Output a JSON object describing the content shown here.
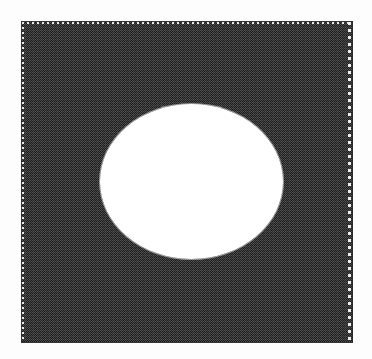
{
  "figure": {
    "caption": "",
    "background_color": "#fdfdfd",
    "panel": {
      "name": "dark-halftone-square",
      "fill_color": "#4b4b4b",
      "dither_dark_color": "#1c1c1c",
      "outline_color": "#2a2a2a",
      "x": 21,
      "y": 21,
      "width": 332,
      "height": 322
    },
    "inner_rule": {
      "name": "dotted-inner-border",
      "color": "#e8e8e8",
      "style": "dotted",
      "edges": [
        "top",
        "left",
        "right"
      ]
    },
    "hole": {
      "name": "white-ellipse-void",
      "fill_color": "#ffffff",
      "shape": "ellipse",
      "center_x": 191,
      "center_y": 181,
      "width": 183,
      "height": 155
    }
  }
}
